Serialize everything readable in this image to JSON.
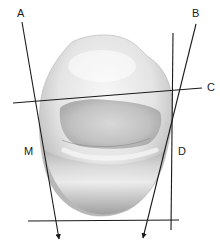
{
  "diagram": {
    "labels": {
      "a": "A",
      "b": "B",
      "c": "C",
      "d": "D",
      "m": "M"
    },
    "colors": {
      "line": "#1a1a1a",
      "tooth_light": "#f4f4f4",
      "tooth_mid": "#d4d4d4",
      "tooth_dark": "#9a9a9a",
      "background": "#ffffff"
    }
  }
}
